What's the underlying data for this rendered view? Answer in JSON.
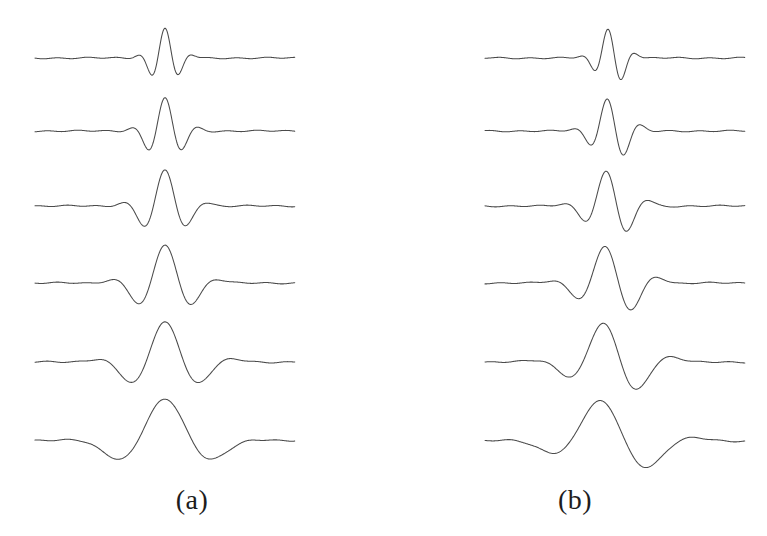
{
  "figure": {
    "type": "seismic-wavelet-trace-figure",
    "background_color": "#ffffff",
    "trace_color": "#4a4a4a",
    "label_color": "#1d1d1d",
    "panel_count": 2,
    "traces_per_panel": 6
  },
  "panels": [
    {
      "id": "a",
      "label": "(a)",
      "phase": "zero-phase-symmetric",
      "origin_x": 0,
      "trace_left": 35,
      "trace_right": 295,
      "center_x": 165,
      "baselines": [
        58,
        131,
        206,
        283,
        362,
        441
      ],
      "traces": [
        {
          "index": 1,
          "frequency_hz": 60,
          "sigma": 13,
          "amplitude": 30,
          "phase_shift": 0.0,
          "baseline_y": 58
        },
        {
          "index": 2,
          "frequency_hz": 48,
          "sigma": 16,
          "amplitude": 33,
          "phase_shift": 0.0,
          "baseline_y": 131
        },
        {
          "index": 3,
          "frequency_hz": 38,
          "sigma": 20,
          "amplitude": 36,
          "phase_shift": 0.0,
          "baseline_y": 206
        },
        {
          "index": 4,
          "frequency_hz": 30,
          "sigma": 25,
          "amplitude": 38,
          "phase_shift": 0.0,
          "baseline_y": 283
        },
        {
          "index": 5,
          "frequency_hz": 23,
          "sigma": 31,
          "amplitude": 40,
          "phase_shift": 0.0,
          "baseline_y": 362
        },
        {
          "index": 6,
          "frequency_hz": 16,
          "sigma": 39,
          "amplitude": 42,
          "phase_shift": 0.0,
          "baseline_y": 441
        }
      ]
    },
    {
      "id": "b",
      "label": "(b)",
      "phase": "mixed-phase-asymmetric",
      "origin_x": 383,
      "trace_left": 102,
      "trace_right": 362,
      "center_x": 228,
      "baselines": [
        58,
        131,
        206,
        283,
        362,
        441
      ],
      "traces": [
        {
          "index": 1,
          "frequency_hz": 60,
          "sigma": 13,
          "amplitude": 30,
          "phase_shift": 0.75,
          "baseline_y": 58
        },
        {
          "index": 2,
          "frequency_hz": 48,
          "sigma": 16,
          "amplitude": 33,
          "phase_shift": 0.75,
          "baseline_y": 131
        },
        {
          "index": 3,
          "frequency_hz": 38,
          "sigma": 20,
          "amplitude": 36,
          "phase_shift": 0.75,
          "baseline_y": 206
        },
        {
          "index": 4,
          "frequency_hz": 30,
          "sigma": 25,
          "amplitude": 38,
          "phase_shift": 0.75,
          "baseline_y": 283
        },
        {
          "index": 5,
          "frequency_hz": 23,
          "sigma": 31,
          "amplitude": 40,
          "phase_shift": 0.75,
          "baseline_y": 362
        },
        {
          "index": 6,
          "frequency_hz": 16,
          "sigma": 39,
          "amplitude": 42,
          "phase_shift": 0.75,
          "baseline_y": 441
        }
      ]
    }
  ],
  "chart_data": {
    "type": "line",
    "title": "",
    "xlabel": "",
    "ylabel": "",
    "grid": false,
    "legend_position": "none",
    "subplots": [
      {
        "name": "(a)",
        "description": "Six zero-phase symmetric seismic wavelets of decreasing dominant frequency, top to bottom.",
        "series": [
          {
            "name": "wavelet-a-1",
            "dominant_frequency_hz": 60,
            "envelope_width_px": 78,
            "peak_amplitude_px": 30,
            "symmetry": "symmetric"
          },
          {
            "name": "wavelet-a-2",
            "dominant_frequency_hz": 48,
            "envelope_width_px": 96,
            "peak_amplitude_px": 33,
            "symmetry": "symmetric"
          },
          {
            "name": "wavelet-a-3",
            "dominant_frequency_hz": 38,
            "envelope_width_px": 120,
            "peak_amplitude_px": 36,
            "symmetry": "symmetric"
          },
          {
            "name": "wavelet-a-4",
            "dominant_frequency_hz": 30,
            "envelope_width_px": 150,
            "peak_amplitude_px": 38,
            "symmetry": "symmetric"
          },
          {
            "name": "wavelet-a-5",
            "dominant_frequency_hz": 23,
            "envelope_width_px": 186,
            "peak_amplitude_px": 40,
            "symmetry": "symmetric"
          },
          {
            "name": "wavelet-a-6",
            "dominant_frequency_hz": 16,
            "envelope_width_px": 234,
            "peak_amplitude_px": 42,
            "symmetry": "symmetric"
          }
        ]
      },
      {
        "name": "(b)",
        "description": "Six mixed-phase asymmetric seismic wavelets of decreasing dominant frequency, top to bottom.",
        "series": [
          {
            "name": "wavelet-b-1",
            "dominant_frequency_hz": 60,
            "envelope_width_px": 78,
            "peak_amplitude_px": 30,
            "symmetry": "asymmetric"
          },
          {
            "name": "wavelet-b-2",
            "dominant_frequency_hz": 48,
            "envelope_width_px": 96,
            "peak_amplitude_px": 33,
            "symmetry": "asymmetric"
          },
          {
            "name": "wavelet-b-3",
            "dominant_frequency_hz": 38,
            "envelope_width_px": 120,
            "peak_amplitude_px": 36,
            "symmetry": "asymmetric"
          },
          {
            "name": "wavelet-b-4",
            "dominant_frequency_hz": 30,
            "envelope_width_px": 150,
            "peak_amplitude_px": 38,
            "symmetry": "asymmetric"
          },
          {
            "name": "wavelet-b-5",
            "dominant_frequency_hz": 23,
            "envelope_width_px": 186,
            "peak_amplitude_px": 40,
            "symmetry": "asymmetric"
          },
          {
            "name": "wavelet-b-6",
            "dominant_frequency_hz": 16,
            "envelope_width_px": 234,
            "peak_amplitude_px": 42,
            "symmetry": "asymmetric"
          }
        ]
      }
    ]
  }
}
